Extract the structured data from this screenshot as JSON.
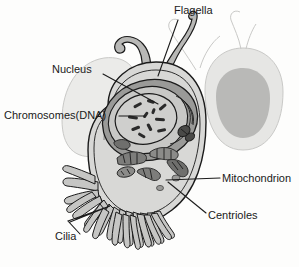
{
  "figure": {
    "kind": "biology-diagram",
    "background_color": "#fdfdfc",
    "ink_color": "#1b1b1b",
    "cytoplasm_color": "#d8d8d6",
    "organelle_color": "#8e8e8c",
    "ghost_color": "#c9c9c7"
  },
  "labels": {
    "flagella": "Flagella",
    "nucleus": "Nucleus",
    "chromosomes": "Chromosomes(DNA)",
    "mitochondrion": "Mitochondrion",
    "centrioles": "Centrioles",
    "cilia": "Cilia"
  },
  "structures": [
    {
      "name": "flagella",
      "label": "Flagella",
      "count": 2,
      "position": "top"
    },
    {
      "name": "nucleus",
      "label": "Nucleus",
      "position": "upper-center"
    },
    {
      "name": "chromosomes",
      "label": "Chromosomes(DNA)",
      "count": 11,
      "position": "inside-nucleus"
    },
    {
      "name": "mitochondrion",
      "label": "Mitochondrion",
      "position": "center-right"
    },
    {
      "name": "centrioles",
      "label": "Centrioles",
      "position": "center-lower"
    },
    {
      "name": "cilia",
      "label": "Cilia",
      "count": 22,
      "position": "lower-left"
    }
  ]
}
